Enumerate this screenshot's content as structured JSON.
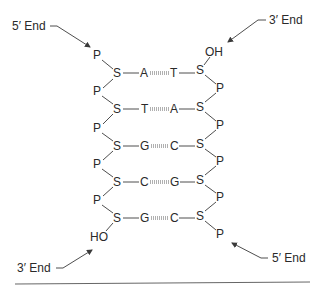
{
  "diagram": {
    "labels": {
      "top_left_end": "5′ End",
      "top_right_end": "3′ End",
      "bottom_left_end": "3′ End",
      "bottom_right_end": "5′ End",
      "left_terminal_group": "HO",
      "right_terminal_group": "OH",
      "phosphate": "P",
      "sugar": "S"
    },
    "base_pairs": [
      {
        "left": "A",
        "right": "T"
      },
      {
        "left": "T",
        "right": "A"
      },
      {
        "left": "G",
        "right": "C"
      },
      {
        "left": "C",
        "right": "G"
      },
      {
        "left": "G",
        "right": "C"
      }
    ],
    "colors": {
      "text": "#2a2a2a",
      "bond": "#3a3a3a",
      "hydrogen_bond": "#b0b0b0",
      "rule": "#555555"
    }
  }
}
